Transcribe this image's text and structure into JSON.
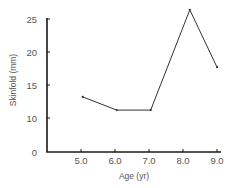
{
  "chart_data": {
    "type": "line",
    "title": "",
    "xlabel": "Age (yr)",
    "ylabel": "Skinfold (mm)",
    "x_ticks": [
      "5.0",
      "6.0",
      "7.0",
      "8.0",
      "9.0"
    ],
    "y_ticks": [
      "0",
      "10",
      "15",
      "20",
      "25"
    ],
    "y_axis_note": "broken axis between 0 and 10",
    "xlim": [
      4.0,
      9.1
    ],
    "ylim": [
      0,
      26.5
    ],
    "grid": false,
    "legend": null,
    "series": [
      {
        "name": "Skinfold",
        "x": [
          5.05,
          6.05,
          7.05,
          8.2,
          9.0
        ],
        "values": [
          13.2,
          11.2,
          11.2,
          26.4,
          17.7
        ]
      }
    ]
  },
  "colors": {
    "axis": "#1a1a1a",
    "line": "#333333",
    "text": "#555555"
  }
}
